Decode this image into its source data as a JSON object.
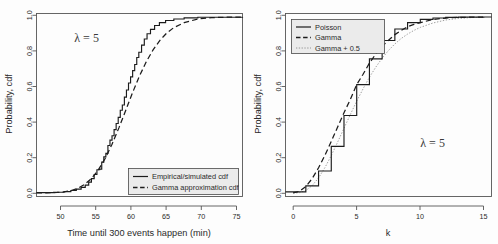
{
  "figure": {
    "background": "#fdfdfd",
    "panel_count": 2
  },
  "chart_data": [
    {
      "type": "line",
      "panel": "left",
      "title": "",
      "xlabel": "Time until 300 events happen (min)",
      "ylabel": "Probability, cdf",
      "xlim": [
        46.5,
        76.5
      ],
      "ylim": [
        -0.02,
        1.02
      ],
      "xticks": [
        50,
        55,
        60,
        65,
        70,
        75
      ],
      "yticks": [
        "0.0",
        "0.2",
        "0.4",
        "0.6",
        "0.8",
        "1.0"
      ],
      "ytick_values": [
        0.0,
        0.2,
        0.4,
        0.6,
        0.8,
        1.0
      ],
      "grid": false,
      "annotation": "λ = 5",
      "annotation_x": 52.0,
      "annotation_y": 0.86,
      "legend_position": "bottom-right",
      "legend": [
        {
          "label": "Empirical/simulated cdf",
          "style": "solid",
          "color": "#1c1c1c"
        },
        {
          "label": "Gamma approximation cdf",
          "style": "dashed",
          "color": "#1c1c1c"
        }
      ],
      "series": [
        {
          "name": "Empirical/simulated cdf",
          "style": "step",
          "x": [
            46.5,
            49.0,
            50.5,
            51.5,
            52.3,
            53.0,
            53.6,
            54.1,
            54.5,
            54.9,
            55.3,
            55.7,
            56.0,
            56.3,
            56.6,
            56.9,
            57.2,
            57.5,
            57.8,
            58.1,
            58.4,
            58.7,
            59.0,
            59.3,
            59.6,
            59.9,
            60.2,
            60.5,
            60.8,
            61.1,
            61.4,
            61.8,
            62.2,
            62.6,
            63.1,
            63.7,
            64.4,
            65.3,
            66.5,
            68.0,
            70.0,
            76.5
          ],
          "y": [
            0.002,
            0.004,
            0.008,
            0.014,
            0.022,
            0.032,
            0.045,
            0.062,
            0.082,
            0.105,
            0.132,
            0.136,
            0.175,
            0.205,
            0.225,
            0.27,
            0.3,
            0.325,
            0.36,
            0.395,
            0.43,
            0.47,
            0.5,
            0.545,
            0.585,
            0.625,
            0.66,
            0.695,
            0.73,
            0.77,
            0.8,
            0.84,
            0.875,
            0.905,
            0.93,
            0.952,
            0.968,
            0.98,
            0.989,
            0.995,
            0.999,
            1.0
          ]
        },
        {
          "name": "Gamma approximation cdf",
          "style": "dashed",
          "x": [
            46.5,
            48.0,
            49.5,
            50.5,
            51.5,
            52.5,
            53.5,
            54.5,
            55.5,
            56.5,
            57.5,
            58.5,
            59.5,
            60.0,
            60.5,
            61.5,
            62.5,
            63.5,
            64.5,
            65.5,
            66.5,
            68.0,
            70.0,
            72.0,
            74.0,
            76.5
          ],
          "y": [
            0.0005,
            0.001,
            0.003,
            0.006,
            0.013,
            0.026,
            0.048,
            0.082,
            0.131,
            0.196,
            0.277,
            0.37,
            0.47,
            0.521,
            0.571,
            0.665,
            0.747,
            0.815,
            0.869,
            0.91,
            0.94,
            0.968,
            0.989,
            0.996,
            0.999,
            1.0
          ]
        }
      ]
    },
    {
      "type": "line",
      "panel": "right",
      "title": "",
      "xlabel": "k",
      "ylabel": "Probability, cdf",
      "xlim": [
        -0.6,
        15.6
      ],
      "ylim": [
        -0.02,
        1.02
      ],
      "xticks": [
        0,
        5,
        10,
        15
      ],
      "yticks": [
        "0.0",
        "0.2",
        "0.4",
        "0.6",
        "0.8",
        "1.0"
      ],
      "ytick_values": [
        0.0,
        0.2,
        0.4,
        0.6,
        0.8,
        1.0
      ],
      "grid": false,
      "annotation": "λ = 5",
      "annotation_x": 10.0,
      "annotation_y": 0.26,
      "legend_position": "top-left",
      "legend": [
        {
          "label": "Poisson",
          "style": "solid",
          "color": "#1c1c1c"
        },
        {
          "label": "Gamma",
          "style": "dashed",
          "color": "#1c1c1c"
        },
        {
          "label": "Gamma + 0.5",
          "style": "dotted",
          "color": "#8c8c8c"
        }
      ],
      "series": [
        {
          "name": "Poisson",
          "style": "step",
          "k": [
            0,
            1,
            2,
            3,
            4,
            5,
            6,
            7,
            8,
            9,
            10,
            11,
            12,
            13,
            14,
            15
          ],
          "values": [
            0.0067,
            0.0404,
            0.1247,
            0.265,
            0.4405,
            0.616,
            0.7622,
            0.8666,
            0.9319,
            0.9682,
            0.9863,
            0.9945,
            0.998,
            0.9993,
            0.9998,
            0.9999
          ]
        },
        {
          "name": "Gamma",
          "style": "dashed",
          "x": [
            0,
            0.5,
            1,
            1.5,
            2,
            2.5,
            3,
            3.5,
            4,
            4.5,
            5,
            5.5,
            6,
            6.5,
            7,
            7.5,
            8,
            8.5,
            9,
            9.5,
            10,
            11,
            12,
            13,
            14,
            15
          ],
          "y": [
            0.0,
            0.009,
            0.037,
            0.082,
            0.143,
            0.214,
            0.293,
            0.375,
            0.456,
            0.532,
            0.616,
            0.675,
            0.738,
            0.79,
            0.833,
            0.868,
            0.9,
            0.924,
            0.945,
            0.958,
            0.968,
            0.986,
            0.994,
            0.998,
            0.999,
            1.0
          ]
        },
        {
          "name": "Gamma + 0.5",
          "style": "dotted",
          "x": [
            0,
            0.5,
            1,
            1.5,
            2,
            2.5,
            3,
            3.5,
            4,
            4.5,
            5,
            5.5,
            6,
            6.5,
            7,
            7.5,
            8,
            8.5,
            9,
            9.5,
            10,
            11,
            12,
            13,
            14,
            15
          ],
          "y": [
            0.0,
            0.002,
            0.014,
            0.042,
            0.086,
            0.144,
            0.213,
            0.289,
            0.368,
            0.446,
            0.522,
            0.592,
            0.658,
            0.715,
            0.766,
            0.81,
            0.847,
            0.878,
            0.903,
            0.924,
            0.941,
            0.966,
            0.983,
            0.992,
            0.997,
            0.999
          ]
        }
      ]
    }
  ]
}
